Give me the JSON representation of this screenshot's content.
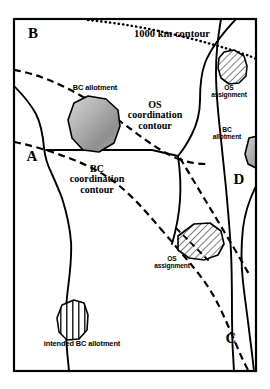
{
  "figure": {
    "type": "schematic-map",
    "background_color": "#ffffff",
    "line_color": "#000000",
    "frame": {
      "x": 14,
      "y": 19,
      "width": 242,
      "height": 352,
      "stroke_width": 2.2
    }
  },
  "region_labels": [
    {
      "id": "region-b",
      "text": "B",
      "x": 29,
      "y": 33
    },
    {
      "id": "region-a",
      "text": "A",
      "x": 28,
      "y": 156
    },
    {
      "id": "region-d",
      "text": "D",
      "x": 236,
      "y": 179
    },
    {
      "id": "region-c",
      "text": "C",
      "x": 228,
      "y": 338
    }
  ],
  "contour_labels": [
    {
      "id": "contour-1000km",
      "text": "1000 km contour",
      "style": "dotted",
      "x": 119,
      "y": 34,
      "width": 106
    },
    {
      "id": "contour-os-coordination",
      "text": "OS\ncoordination\ncontour",
      "style": "dashed",
      "x": 116,
      "y": 105,
      "width": 78
    },
    {
      "id": "contour-bc-coordination",
      "text": "BC\ncoordination\ncontour",
      "style": "dashed",
      "x": 58,
      "y": 169,
      "width": 78
    }
  ],
  "polygons": [
    {
      "id": "bc-allotment-upper-left",
      "label": "BC allotment",
      "fill": "gradient-gray",
      "label_x": 56,
      "label_y": 88,
      "label_width": 78
    },
    {
      "id": "os-assignment-upper-right",
      "label": "OS\nassignment",
      "fill": "diagonal-hatch",
      "label_x": 200,
      "label_y": 86,
      "label_width": 58
    },
    {
      "id": "bc-allotment-right-edge",
      "label": "BC\nallotment",
      "fill": "gradient-gray",
      "label_x": 203,
      "label_y": 129,
      "label_width": 48
    },
    {
      "id": "os-assignment-lower-middle",
      "label": "OS\nassignment",
      "fill": "diagonal-hatch",
      "label_x": 143,
      "label_y": 258,
      "label_width": 58
    },
    {
      "id": "intended-bc-allotment",
      "label": "intended BC allotment",
      "fill": "vertical-stripe",
      "label_x": 24,
      "label_y": 343,
      "label_width": 116
    }
  ],
  "legend_styles": {
    "solid_boundary": "solid",
    "coordination_contour": "dashed",
    "km_contour": "dotted"
  }
}
